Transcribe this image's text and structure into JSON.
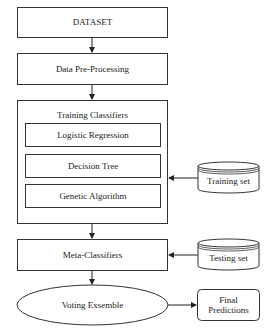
{
  "diagram": {
    "nodes": {
      "dataset": "DATASET",
      "preprocessing": "Data Pre-Processing",
      "training_group": {
        "title": "Training Classifiers",
        "classifiers": [
          "Logistic Regression",
          "Decision Tree",
          "Genetic Algorithm"
        ]
      },
      "training_set": "Training set",
      "meta_classifiers": "Meta-Classifiers",
      "testing_set": "Testing set",
      "voting": "Voting Exsemble",
      "final_predictions_line1": "Final",
      "final_predictions_line2": "Predictions"
    },
    "edges": [
      {
        "from": "DATASET",
        "to": "Data Pre-Processing"
      },
      {
        "from": "Data Pre-Processing",
        "to": "Training Classifiers"
      },
      {
        "from": "Training set",
        "to": "Training Classifiers"
      },
      {
        "from": "Training Classifiers",
        "to": "Meta-Classifiers"
      },
      {
        "from": "Testing set",
        "to": "Meta-Classifiers"
      },
      {
        "from": "Meta-Classifiers",
        "to": "Voting Exsemble"
      },
      {
        "from": "Voting Exsemble",
        "to": "Final Predictions"
      }
    ],
    "colors": {
      "stroke": "#333333",
      "fill": "#ffffff",
      "text": "#222222"
    }
  }
}
